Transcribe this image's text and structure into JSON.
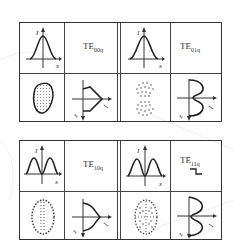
{
  "figure": {
    "type": "waveguide mode patterns",
    "panels": [
      {
        "id": "top",
        "modes": [
          {
            "name": "TE",
            "sub": "00q",
            "label": "TE00q",
            "intensity_profile": "single-peak",
            "spot": "single filled spot",
            "axial": "single lobe"
          },
          {
            "name": "TE",
            "sub": "01q",
            "label": "TE01q",
            "intensity_profile": "single-peak",
            "spot": "two dotted spots stacked vertically",
            "axial": "double lobe"
          }
        ]
      },
      {
        "id": "bottom",
        "modes": [
          {
            "name": "TE",
            "sub": "10q",
            "label": "TE10q",
            "intensity_profile": "double-peak",
            "spot": "dotted ellipse with center dotted line",
            "axial": "single lobe"
          },
          {
            "name": "TE",
            "sub": "11q",
            "label": "TE11q",
            "intensity_profile": "double-peak",
            "spot": "dotted ellipse with four quadrants",
            "axial": "double lobe",
            "extra_symbol": "step"
          }
        ]
      }
    ],
    "axis_labels": {
      "intensity": "I",
      "x": "x",
      "z": "z"
    }
  }
}
